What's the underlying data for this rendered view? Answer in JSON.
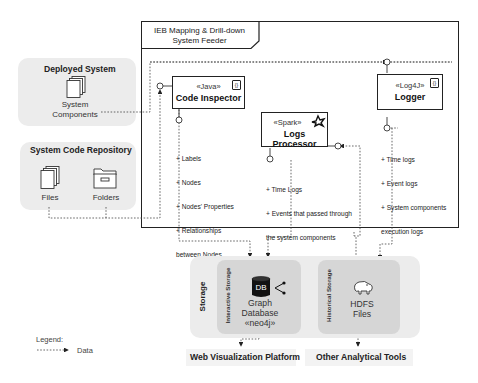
{
  "feeder": {
    "title_line1": "IEB Mapping & Drill-down",
    "title_line2": "System Feeder",
    "components": [
      {
        "stereotype": "«Java»",
        "name": "Code Inspector",
        "icon": "component-icon"
      },
      {
        "stereotype": "«Spark»",
        "name": "Logs Processor",
        "icon": "spark-star-icon"
      },
      {
        "stereotype": "«Log4J»",
        "name": "Logger",
        "icon": "component-icon"
      }
    ],
    "notes": {
      "code_inspector": [
        "+ Labels",
        "+ Nodes",
        "+ Nodes' Properties",
        "+ Relationships",
        "between Nodes"
      ],
      "logs_processor": [
        "+ Time Logs",
        "+ Events that passed through",
        "the system components",
        "+ System components that",
        "were running"
      ],
      "logger": [
        "+ Time logs",
        "+ Event logs",
        "+ System components",
        "execution logs"
      ]
    }
  },
  "deployed_system": {
    "title": "Deployed System",
    "item_line1": "System",
    "item_line2": "Components"
  },
  "repository": {
    "title": "System Code Repository",
    "files": "Files",
    "folders": "Folders"
  },
  "storage": {
    "title": "Storage",
    "interactive": {
      "label": "Interactive Storage",
      "db_badge": "DB",
      "line1": "Graph",
      "line2": "Database",
      "line3": "«neo4j»"
    },
    "historical": {
      "label": "Historical Storage",
      "line1": "HDFS",
      "line2": "Files"
    }
  },
  "outputs": {
    "web": "Web Visualization Platform",
    "tools": "Other Analytical Tools"
  },
  "legend": {
    "title": "Legend:",
    "data": "Data"
  },
  "colors": {
    "group_bg": "#ececec",
    "inner_bg": "#d6d6d6",
    "line": "#222222",
    "dashed": "#444444"
  }
}
